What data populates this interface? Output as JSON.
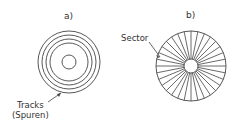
{
  "panels": [
    {
      "label": "a)",
      "annotation_line1": "Tracks",
      "annotation_line2": "(Spuren)",
      "ring_radii": [
        31,
        27,
        23,
        19
      ],
      "inner_radius": 7
    },
    {
      "label": "b)",
      "annotation": "Sector",
      "outer_radius": 35,
      "hub_radius": 7,
      "spokes": 32
    }
  ],
  "colors": {
    "stroke": "#444444",
    "text": "#333333"
  }
}
